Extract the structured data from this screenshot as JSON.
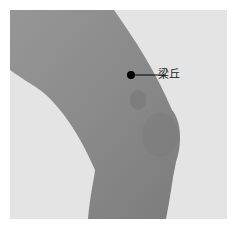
{
  "figure": {
    "acupoint": {
      "label": "梁丘",
      "marker_color": "#000000"
    },
    "colors": {
      "background": "#e6e6e6",
      "skin": "#8e8e8e",
      "skin_shadow": "#7a7a7a"
    }
  }
}
